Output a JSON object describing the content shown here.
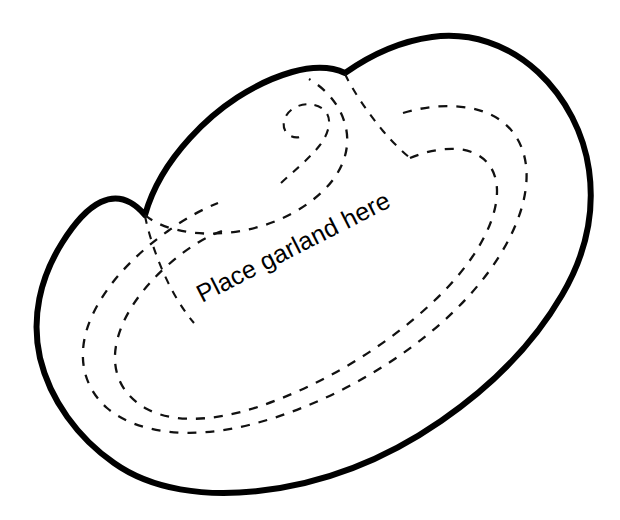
{
  "document": {
    "type": "craft-pattern-template",
    "subject": "hat-pattern-outline"
  },
  "annotations": {
    "garland_label": "Place garland here"
  },
  "colors": {
    "background": "#ffffff",
    "outline": "#000000",
    "fold_line": "#111111"
  },
  "shapes": {
    "outer_outline_name": "hat-outer-outline",
    "crown_name": "hat-crown-fold-line",
    "spiral_name": "crown-spiral-fold-line",
    "brim_inner_name": "brim-inner-fold-line",
    "brim_outer_name": "brim-outer-fold-line",
    "notch_name": "crown-notch-fold-line"
  },
  "label_layout": {
    "rotation_deg": -27,
    "x": 202,
    "y": 303
  }
}
